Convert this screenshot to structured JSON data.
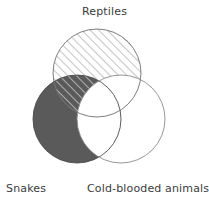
{
  "figure": {
    "type": "venn-diagram",
    "set_count": 3,
    "background_color": "#ffffff"
  },
  "labels": {
    "top": "Reptiles",
    "bottom_left": "Snakes",
    "bottom_right": "Cold-blooded animals"
  },
  "sets": [
    {
      "id": "reptiles",
      "name": "Reptiles",
      "label_position": "top",
      "fill_style": "diagonal-hatch",
      "fill_color": "#ffffff",
      "hatch_color": "#9a9a9a",
      "stroke_color": "#6e6e6e",
      "cx": 97,
      "cy": 73,
      "r": 44
    },
    {
      "id": "snakes",
      "name": "Snakes",
      "label_position": "bottom-left",
      "fill_style": "solid",
      "fill_color": "#5a5a5a",
      "hatch_color": "#ffffff",
      "stroke_color": "#4a4a4a",
      "cx": 77,
      "cy": 119,
      "r": 44
    },
    {
      "id": "cold-blooded",
      "name": "Cold-blooded animals",
      "label_position": "bottom-right",
      "fill_style": "solid",
      "fill_color": "#ffffff",
      "hatch_color": "none",
      "stroke_color": "#8a8a8a",
      "cx": 121,
      "cy": 119,
      "r": 44
    }
  ],
  "colors": {
    "dark_fill": "#5a5a5a",
    "hatch_line": "#9a9a9a",
    "outline": "#6e6e6e",
    "outline_light": "#8a8a8a",
    "text": "#3c3c3c",
    "background": "#ffffff"
  }
}
